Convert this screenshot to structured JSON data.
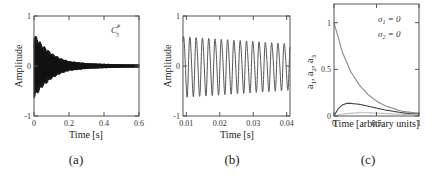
{
  "chart_data": [
    {
      "id": "a",
      "type": "line",
      "caption": "(a)",
      "title": "",
      "xlabel": "Time [s]",
      "ylabel": "Amplitude",
      "annotation": "C#5",
      "annotation_base": "C",
      "annotation_sup": "#",
      "annotation_sub": "5",
      "xlim": [
        0,
        0.6
      ],
      "ylim": [
        -1,
        1
      ],
      "xticks": [
        0,
        0.2,
        0.4,
        0.6
      ],
      "xtick_labels": [
        "0",
        "0.2",
        "0.4",
        "0.6"
      ],
      "yticks": [
        -1,
        0,
        1
      ],
      "ytick_labels": [
        "-1",
        "0",
        "1"
      ],
      "grid": false,
      "description": "Dense decaying waveform (piano note C#5); envelope starts ~0.65 at t=0 and decays to ~0.03 by t=0.6",
      "envelope": {
        "x": [
          0,
          0.05,
          0.1,
          0.15,
          0.2,
          0.3,
          0.4,
          0.5,
          0.6
        ],
        "y": [
          0.65,
          0.42,
          0.26,
          0.16,
          0.1,
          0.06,
          0.045,
          0.035,
          0.03
        ]
      }
    },
    {
      "id": "b",
      "type": "line",
      "caption": "(b)",
      "title": "",
      "xlabel": "Time [s]",
      "ylabel": "Amplitude",
      "xlim": [
        0.009,
        0.041
      ],
      "ylim": [
        -1,
        1
      ],
      "xticks": [
        0.01,
        0.02,
        0.03,
        0.04
      ],
      "xtick_labels": [
        "0.01",
        "0.02",
        "0.03",
        "0.04"
      ],
      "yticks": [
        -1,
        0,
        1
      ],
      "ytick_labels": [
        "-1",
        "0",
        "1"
      ],
      "grid": false,
      "description": "Zoomed view of waveform: ~17 cycles of a near-sinusoid with amplitude slowly decaying from ~0.6 to ~0.45",
      "cycles": 17,
      "amplitude_start": 0.6,
      "amplitude_end": 0.45
    },
    {
      "id": "c",
      "type": "line",
      "caption": "(c)",
      "title": "",
      "xlabel": "Time [arbitrary units]",
      "ylabel": "a1, a2, a3",
      "ylabel_parts": [
        "a",
        "1",
        ", a",
        "2",
        ", a",
        "3"
      ],
      "annotations": [
        "σ1 = 0",
        "σ2 = 0"
      ],
      "annotation_lines": [
        {
          "sym": "σ",
          "sub": "1",
          "rest": " = 0"
        },
        {
          "sym": "σ",
          "sub": "2",
          "rest": " = 0"
        }
      ],
      "xlim": [
        0,
        1
      ],
      "ylim": [
        0,
        1.2
      ],
      "xticks": [
        0,
        0.5,
        1
      ],
      "xtick_labels": [
        "0",
        "0.5",
        "1"
      ],
      "yticks": [
        0,
        0.5,
        1
      ],
      "ytick_labels": [
        "0",
        "0.5",
        "1"
      ],
      "grid": false,
      "series": [
        {
          "name": "a1",
          "x": [
            0,
            0.1,
            0.2,
            0.3,
            0.4,
            0.5,
            0.6,
            0.7,
            0.8,
            0.9,
            1.0
          ],
          "values": [
            1.0,
            0.68,
            0.47,
            0.33,
            0.23,
            0.16,
            0.11,
            0.08,
            0.05,
            0.04,
            0.03
          ],
          "color": "#8a8a8a"
        },
        {
          "name": "a2",
          "x": [
            0,
            0.05,
            0.1,
            0.15,
            0.2,
            0.3,
            0.4,
            0.5,
            0.6,
            0.7,
            0.8,
            0.9,
            1.0
          ],
          "values": [
            0,
            0.08,
            0.12,
            0.135,
            0.135,
            0.125,
            0.105,
            0.085,
            0.065,
            0.05,
            0.035,
            0.025,
            0.02
          ],
          "color": "#444444"
        },
        {
          "name": "a3",
          "x": [
            0,
            0.1,
            0.2,
            0.3,
            0.4,
            0.5,
            0.6,
            0.7,
            0.8,
            0.9,
            1.0
          ],
          "values": [
            0,
            0.02,
            0.03,
            0.035,
            0.035,
            0.03,
            0.027,
            0.022,
            0.018,
            0.015,
            0.012
          ],
          "color": "#bdbdbd"
        }
      ]
    }
  ]
}
